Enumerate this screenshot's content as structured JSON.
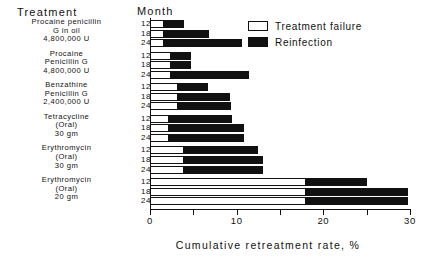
{
  "header": {
    "treatment_label": "Treatment",
    "month_label": "Month"
  },
  "legend": {
    "position": "top-right",
    "items": [
      {
        "label": "Treatment failure",
        "style": "hollow",
        "color": "#ffffff"
      },
      {
        "label": "Reinfection",
        "style": "filled",
        "color": "#111111"
      }
    ]
  },
  "axis": {
    "xlabel": "Cumulative retreatment rate, %",
    "ticks": [
      0,
      5,
      10,
      15,
      20,
      25,
      30
    ],
    "tick_labels": [
      "0",
      "",
      "10",
      "",
      "20",
      "",
      "30"
    ],
    "xlim": [
      0,
      30
    ]
  },
  "groups": [
    {
      "lines": [
        "Procaine penicillin",
        "G in oil",
        "4,800,000 U"
      ],
      "months": [
        "12",
        "18",
        "24"
      ]
    },
    {
      "lines": [
        "Procaine",
        "Penicillin G",
        "4,800,000 U"
      ],
      "months": [
        "12",
        "18",
        "24"
      ]
    },
    {
      "lines": [
        "Benzathine",
        "Penicillin G",
        "2,400,000 U"
      ],
      "months": [
        "12",
        "18",
        "24"
      ]
    },
    {
      "lines": [
        "Tetracycline",
        "(Oral)",
        "30 gm"
      ],
      "months": [
        "12",
        "18",
        "24"
      ]
    },
    {
      "lines": [
        "Erythromycin",
        "(Oral)",
        "30 gm"
      ],
      "months": [
        "12",
        "18",
        "24"
      ]
    },
    {
      "lines": [
        "Erythromycin",
        "(Oral)",
        "20 gm"
      ],
      "months": [
        "12",
        "18",
        "24"
      ]
    }
  ],
  "chart_data": {
    "type": "bar",
    "orientation": "horizontal",
    "stacked": true,
    "title": "",
    "xlabel": "Cumulative retreatment rate, %",
    "ylabel": "Treatment",
    "xlim": [
      0,
      30
    ],
    "grid": false,
    "legend_position": "top-right",
    "series": [
      {
        "name": "Treatment failure",
        "color": "#ffffff"
      },
      {
        "name": "Reinfection",
        "color": "#111111"
      }
    ],
    "categories": [
      "Procaine penicillin G in oil 4,800,000 U - 12",
      "Procaine penicillin G in oil 4,800,000 U - 18",
      "Procaine penicillin G in oil 4,800,000 U - 24",
      "Procaine Penicillin G 4,800,000 U - 12",
      "Procaine Penicillin G 4,800,000 U - 18",
      "Procaine Penicillin G 4,800,000 U - 24",
      "Benzathine Penicillin G 2,400,000 U - 12",
      "Benzathine Penicillin G 2,400,000 U - 18",
      "Benzathine Penicillin G 2,400,000 U - 24",
      "Tetracycline (Oral) 30 gm - 12",
      "Tetracycline (Oral) 30 gm - 18",
      "Tetracycline (Oral) 30 gm - 24",
      "Erythromycin (Oral) 30 gm - 12",
      "Erythromycin (Oral) 30 gm - 18",
      "Erythromycin (Oral) 30 gm - 24",
      "Erythromycin (Oral) 20 gm - 12",
      "Erythromycin (Oral) 20 gm - 18",
      "Erythromycin (Oral) 20 gm - 24"
    ],
    "bars": [
      {
        "group": 0,
        "month": "12",
        "failure": 1.6,
        "total": 3.9
      },
      {
        "group": 0,
        "month": "18",
        "failure": 1.6,
        "total": 6.8
      },
      {
        "group": 0,
        "month": "24",
        "failure": 1.6,
        "total": 10.6
      },
      {
        "group": 1,
        "month": "12",
        "failure": 2.4,
        "total": 4.7
      },
      {
        "group": 1,
        "month": "18",
        "failure": 2.4,
        "total": 4.7
      },
      {
        "group": 1,
        "month": "24",
        "failure": 2.4,
        "total": 11.4
      },
      {
        "group": 2,
        "month": "12",
        "failure": 3.2,
        "total": 6.7
      },
      {
        "group": 2,
        "month": "18",
        "failure": 3.2,
        "total": 9.2
      },
      {
        "group": 2,
        "month": "24",
        "failure": 3.2,
        "total": 9.3
      },
      {
        "group": 3,
        "month": "12",
        "failure": 2.2,
        "total": 9.5
      },
      {
        "group": 3,
        "month": "18",
        "failure": 2.2,
        "total": 10.8
      },
      {
        "group": 3,
        "month": "24",
        "failure": 2.2,
        "total": 10.8
      },
      {
        "group": 4,
        "month": "12",
        "failure": 3.9,
        "total": 12.5
      },
      {
        "group": 4,
        "month": "18",
        "failure": 3.9,
        "total": 13.0
      },
      {
        "group": 4,
        "month": "24",
        "failure": 3.9,
        "total": 13.0
      },
      {
        "group": 5,
        "month": "12",
        "failure": 18.0,
        "total": 25.0
      },
      {
        "group": 5,
        "month": "18",
        "failure": 18.0,
        "total": 29.8
      },
      {
        "group": 5,
        "month": "24",
        "failure": 18.0,
        "total": 29.8
      }
    ]
  }
}
